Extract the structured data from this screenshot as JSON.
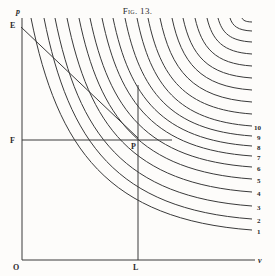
{
  "figure": {
    "caption": "Fig. 13.",
    "axis_labels": {
      "y_axis": "p",
      "x_axis": "v",
      "origin": "O"
    },
    "point_labels": {
      "E": "E",
      "F": "F",
      "P": "P",
      "L": "L"
    },
    "curve_labels": [
      "1",
      "2",
      "3",
      "4",
      "5",
      "6",
      "7",
      "8",
      "9",
      "10"
    ],
    "colors": {
      "ink": "#3a3a3a",
      "paper": "#fdfcfa"
    }
  },
  "curves": [
    {
      "top_x": 31,
      "right_y": 230
    },
    {
      "top_x": 44,
      "right_y": 219
    },
    {
      "top_x": 55,
      "right_y": 206
    },
    {
      "top_x": 67,
      "right_y": 192
    },
    {
      "top_x": 79,
      "right_y": 179
    },
    {
      "top_x": 90,
      "right_y": 167
    },
    {
      "top_x": 102,
      "right_y": 156
    },
    {
      "top_x": 113,
      "right_y": 146
    },
    {
      "top_x": 125,
      "right_y": 136
    },
    {
      "top_x": 137,
      "right_y": 126
    },
    {
      "top_x": 148,
      "right_y": 114
    },
    {
      "top_x": 160,
      "right_y": 102
    },
    {
      "top_x": 172,
      "right_y": 90
    },
    {
      "top_x": 183,
      "right_y": 78
    },
    {
      "top_x": 195,
      "right_y": 66
    },
    {
      "top_x": 207,
      "right_y": 54
    },
    {
      "top_x": 218,
      "right_y": 42
    },
    {
      "top_x": 230,
      "right_y": 31
    },
    {
      "top_x": 242,
      "right_y": 22
    }
  ]
}
